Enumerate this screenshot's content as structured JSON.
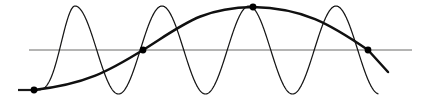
{
  "figure": {
    "background_color": "#ffffff",
    "width": 421,
    "height": 106
  },
  "chart_data": {
    "type": "line",
    "xlabel": "",
    "ylabel": "",
    "xlim": [
      0,
      421
    ],
    "ylim": [
      106,
      0
    ],
    "grid": false,
    "legend": "none",
    "axis": {
      "baseline_y": 50,
      "baseline_x_start": 29,
      "baseline_x_end": 412,
      "color": "#6b6b68",
      "width": 1
    },
    "series": [
      {
        "name": "high-frequency-sinusoid",
        "type": "line",
        "color": "#161616",
        "width": 1.25,
        "cycles": 4,
        "period": 87,
        "amplitude": 44,
        "peaks_x": [
          75,
          163,
          250,
          348
        ],
        "peaks_y": [
          6,
          8,
          9,
          8
        ],
        "troughs_x": [
          118,
          205,
          293
        ],
        "troughs_y": [
          97,
          96,
          96
        ],
        "zero_crossings_x": [
          50,
          97,
          140,
          185,
          228,
          272,
          316,
          368
        ],
        "x_start": 34,
        "y_start": 90,
        "x_end": 378,
        "y_end": 78
      },
      {
        "name": "smooth-envelope-curve",
        "type": "line",
        "color": "#101010",
        "width": 2.5,
        "x_start": 34,
        "y_start": 90,
        "x_end": 388,
        "y_end": 72,
        "apex_x": 253,
        "apex_y": 7,
        "baseline_crossings_x": [
          143,
          368
        ]
      }
    ],
    "markers": [
      {
        "name": "left-anchor-point",
        "x": 34,
        "y": 90,
        "radius": 3.4,
        "color": "#000000"
      },
      {
        "name": "ascending-crossing-point",
        "x": 143,
        "y": 50,
        "radius": 3.4,
        "color": "#000000"
      },
      {
        "name": "apex-tangency-point",
        "x": 253,
        "y": 7,
        "radius": 3.4,
        "color": "#000000"
      },
      {
        "name": "descending-crossing-point",
        "x": 368,
        "y": 50,
        "radius": 3.4,
        "color": "#000000"
      }
    ],
    "stub": {
      "name": "left-baseline-stub",
      "x_start": 18,
      "x_end": 38,
      "y": 90,
      "color": "#1a1a1a",
      "width": 2.2
    },
    "tick_labels": [],
    "annotations": []
  }
}
